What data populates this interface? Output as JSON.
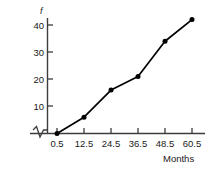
{
  "chart_data": {
    "type": "line",
    "title": "",
    "subtitle": "",
    "xlabel": "Months",
    "ylabel": "f",
    "x": [
      0.5,
      12.5,
      24.5,
      36.5,
      48.5,
      60.5
    ],
    "xtick_labels": [
      "0.5",
      "12.5",
      "24.5",
      "36.5",
      "48.5",
      "60.5"
    ],
    "values": [
      0,
      6,
      16,
      21,
      34,
      42
    ],
    "ytick_labels": [
      "10",
      "20",
      "30",
      "40"
    ],
    "yticks": [
      10,
      20,
      30,
      40
    ],
    "ylim": [
      0,
      46
    ],
    "xlim": [
      0.5,
      60.5
    ],
    "grid": false,
    "legend": null,
    "markers": "filled-circle",
    "line_color": "#000000",
    "marker_color": "#000000",
    "axis_color": "#3c3c3c",
    "axis_break_x": true,
    "series": [
      {
        "name": "f",
        "values": [
          0,
          6,
          16,
          21,
          34,
          42
        ]
      }
    ]
  }
}
